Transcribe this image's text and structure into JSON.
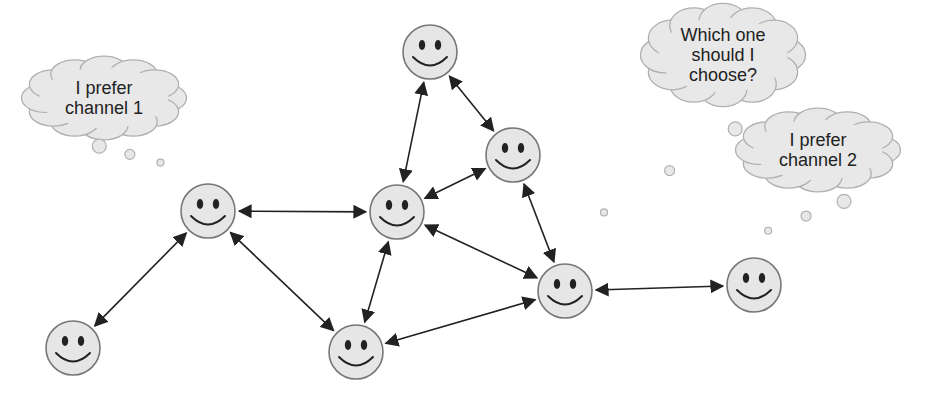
{
  "diagram": {
    "colors": {
      "face_fill": "#e6e6e6",
      "face_stroke": "#777777",
      "feature": "#222222",
      "edge": "#222222",
      "cloud_fill": "#e8e8e8",
      "cloud_stroke": "#b0b0b0"
    },
    "nodes": [
      {
        "id": "n_top",
        "x": 430,
        "y": 52
      },
      {
        "id": "n_upper_right",
        "x": 513,
        "y": 155
      },
      {
        "id": "n_center",
        "x": 397,
        "y": 212
      },
      {
        "id": "n_left",
        "x": 208,
        "y": 211
      },
      {
        "id": "n_bottom_left",
        "x": 73,
        "y": 348
      },
      {
        "id": "n_bottom_center",
        "x": 356,
        "y": 352
      },
      {
        "id": "n_right",
        "x": 565,
        "y": 291
      },
      {
        "id": "n_far_right",
        "x": 754,
        "y": 285
      }
    ],
    "edges": [
      {
        "from": "n_left",
        "to": "n_center"
      },
      {
        "from": "n_left",
        "to": "n_bottom_left"
      },
      {
        "from": "n_left",
        "to": "n_bottom_center"
      },
      {
        "from": "n_center",
        "to": "n_top"
      },
      {
        "from": "n_center",
        "to": "n_upper_right"
      },
      {
        "from": "n_center",
        "to": "n_right"
      },
      {
        "from": "n_center",
        "to": "n_bottom_center"
      },
      {
        "from": "n_top",
        "to": "n_upper_right"
      },
      {
        "from": "n_upper_right",
        "to": "n_right"
      },
      {
        "from": "n_bottom_center",
        "to": "n_right"
      },
      {
        "from": "n_right",
        "to": "n_far_right"
      }
    ],
    "thought_bubbles": [
      {
        "id": "bubble_channel1",
        "lines": [
          "I prefer",
          "channel 1"
        ],
        "cx": 104,
        "cy": 98,
        "attached_to": "n_left"
      },
      {
        "id": "bubble_choose",
        "lines": [
          "Which one",
          "should I",
          "choose?"
        ],
        "cx": 723,
        "cy": 55,
        "attached_to": "n_right"
      },
      {
        "id": "bubble_channel2",
        "lines": [
          "I prefer",
          "channel 2"
        ],
        "cx": 818,
        "cy": 150,
        "attached_to": "n_far_right"
      }
    ]
  }
}
